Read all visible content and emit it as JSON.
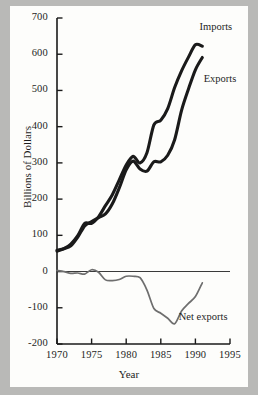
{
  "chart_data": {
    "type": "line",
    "title": "",
    "xlabel": "Year",
    "ylabel": "Billions of Dollars",
    "xlim": [
      1970,
      1995
    ],
    "ylim": [
      -200,
      700
    ],
    "xticks": [
      1970,
      1975,
      1980,
      1985,
      1990,
      1995
    ],
    "yticks": [
      -200,
      -100,
      0,
      100,
      200,
      300,
      400,
      500,
      600,
      700
    ],
    "grid": false,
    "legend": "inline-annotations",
    "zero_line": 0,
    "x": [
      1970,
      1971,
      1972,
      1973,
      1974,
      1975,
      1976,
      1977,
      1978,
      1979,
      1980,
      1981,
      1982,
      1983,
      1984,
      1985,
      1986,
      1987,
      1988,
      1989,
      1990,
      1991
    ],
    "series": [
      {
        "name": "Imports",
        "color": "#1a1a1a",
        "width": 3.1,
        "label": "Imports",
        "values": [
          56,
          63,
          76,
          99,
          133,
          133,
          151,
          182,
          212,
          253,
          294,
          318,
          300,
          328,
          405,
          418,
          450,
          508,
          554,
          592,
          626,
          622
        ]
      },
      {
        "name": "Exports",
        "color": "#1a1a1a",
        "width": 3.1,
        "label": "Exports",
        "values": [
          59,
          63,
          71,
          95,
          126,
          138,
          149,
          159,
          187,
          231,
          281,
          305,
          283,
          277,
          303,
          303,
          321,
          364,
          445,
          504,
          557,
          591
        ]
      },
      {
        "name": "Net exports",
        "color": "#6e6e6e",
        "width": 1.7,
        "label": "Net exports",
        "values": [
          3,
          0,
          -5,
          -4,
          -7,
          5,
          -2,
          -23,
          -25,
          -22,
          -13,
          -13,
          -17,
          -51,
          -102,
          -115,
          -129,
          -144,
          -109,
          -88,
          -69,
          -31
        ]
      }
    ],
    "annotations": [
      {
        "text": "Imports",
        "x": 1990.6,
        "y": 672
      },
      {
        "text": "Exports",
        "x": 1991.2,
        "y": 530
      },
      {
        "text": "Net exports",
        "x": 1987.6,
        "y": -128
      }
    ]
  }
}
